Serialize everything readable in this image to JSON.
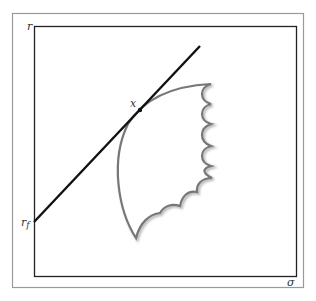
{
  "figure": {
    "type": "efficient-frontier-diagram",
    "y_axis_label": "r",
    "x_axis_label": "σ",
    "intercept_label": "r",
    "intercept_subscript": "f",
    "tangency_label": "x",
    "elements": {
      "capital_market_line": "straight line from risk-free rate tangent to the frontier",
      "feasible_region": "scalloped shaded region of risky portfolios",
      "tangency_point": "point x where the line touches the frontier"
    }
  },
  "colors": {
    "outer_frame": "#9a9a9a",
    "axis_box": "#222222",
    "line": "#111111",
    "region_stroke": "#777777",
    "region_shadow": "#bbbbbb"
  }
}
